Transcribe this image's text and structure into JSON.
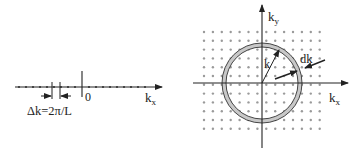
{
  "left_panel": {
    "axis_label": "k",
    "axis_label_sub": "x",
    "origin_label": "0",
    "spacing_label": "Δk=2π/L"
  },
  "right_panel": {
    "x_axis_label": "k",
    "x_axis_label_sub": "x",
    "y_axis_label": "k",
    "y_axis_label_sub": "y",
    "radius_label": "k",
    "shell_label": "dk"
  },
  "colors": {
    "ink": "#222222",
    "dots": "#9a9a9a",
    "shell_fill": "#c8c8c8"
  }
}
